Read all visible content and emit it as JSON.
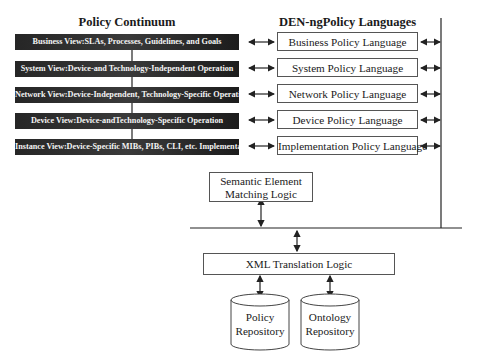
{
  "headings": {
    "left": "Policy Continuum",
    "right": "DEN-ngPolicy Languages"
  },
  "continuum": [
    {
      "label": "Business View:SLAs, Processes, Guidelines, and Goals"
    },
    {
      "label": "System View:Device-and Technology-Independent Operation"
    },
    {
      "label": "Network View:Device-Independent, Technology-Specific Operation"
    },
    {
      "label": "Device View:Device-andTechnology-Specific Operation"
    },
    {
      "label": "Instance View:Device-Specific MIBs, PIBs, CLI, etc. Implementation"
    }
  ],
  "languages": [
    {
      "label": "Business Policy Language"
    },
    {
      "label": "System Policy Language"
    },
    {
      "label": "Network Policy Language"
    },
    {
      "label": "Device Policy Language"
    },
    {
      "label": "Implementation Policy Language"
    }
  ],
  "semantic": {
    "line1": "Semantic Element",
    "line2": "Matching Logic"
  },
  "xml": {
    "label": "XML Translation Logic"
  },
  "repositories": [
    {
      "line1": "Policy",
      "line2": "Repository"
    },
    {
      "line1": "Ontology",
      "line2": "Repository"
    }
  ],
  "colors": {
    "bar": "#2a2a2a",
    "line": "#333333"
  }
}
